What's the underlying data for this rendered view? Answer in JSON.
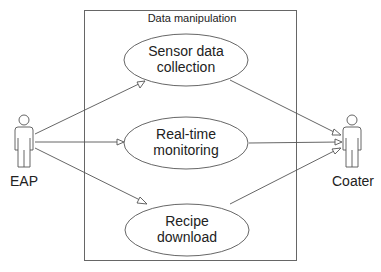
{
  "diagram": {
    "type": "uml-use-case",
    "system": {
      "title": "Data manipulation"
    },
    "actors": [
      {
        "id": "eap",
        "label": "EAP",
        "side": "left"
      },
      {
        "id": "coater",
        "label": "Coater",
        "side": "right"
      }
    ],
    "use_cases": [
      {
        "id": "uc1",
        "line1": "Sensor data",
        "line2": "collection"
      },
      {
        "id": "uc2",
        "line1": "Real-time",
        "line2": "monitoring"
      },
      {
        "id": "uc3",
        "line1": "Recipe",
        "line2": "download"
      }
    ],
    "associations": [
      {
        "from": "eap",
        "to": "uc1",
        "arrow": "open-triangle"
      },
      {
        "from": "eap",
        "to": "uc2",
        "arrow": "open-triangle"
      },
      {
        "from": "eap",
        "to": "uc3",
        "arrow": "open-triangle"
      },
      {
        "from": "uc1",
        "to": "coater",
        "arrow": "open-triangle"
      },
      {
        "from": "uc2",
        "to": "coater",
        "arrow": "open-triangle"
      },
      {
        "from": "uc3",
        "to": "coater",
        "arrow": "open-triangle"
      }
    ],
    "colors": {
      "stroke": "#555555",
      "text": "#222222",
      "background": "#ffffff"
    }
  }
}
